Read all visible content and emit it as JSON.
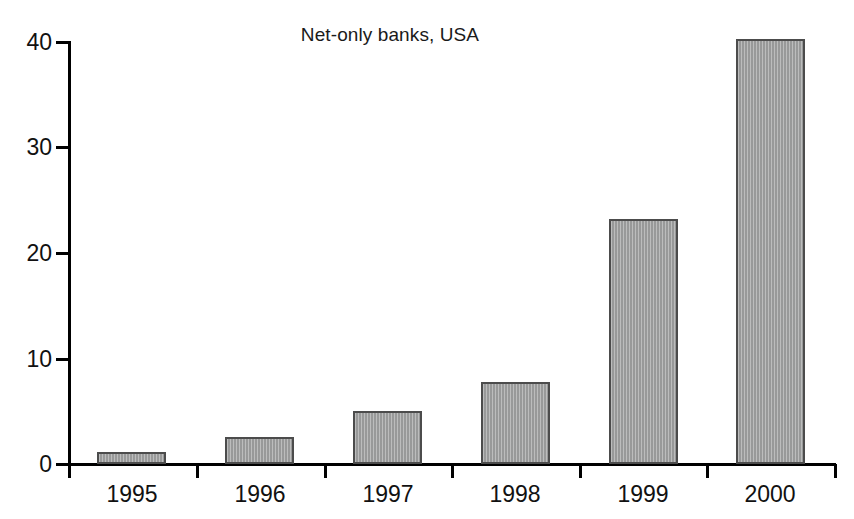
{
  "chart_data": {
    "type": "bar",
    "title": "Net-only banks, USA",
    "xlabel": "",
    "ylabel": "",
    "categories": [
      "1995",
      "1996",
      "1997",
      "1998",
      "1999",
      "2000"
    ],
    "values": [
      1.1,
      2.6,
      5.0,
      7.8,
      23.2,
      40.3
    ],
    "ylim": [
      0,
      40
    ],
    "y_ticks": [
      0,
      10,
      20,
      30,
      40
    ],
    "y_tick_labels": [
      "0",
      "10",
      "20",
      "30",
      "40"
    ],
    "grid": false,
    "legend": "none",
    "bar_color": "#9fa0a0",
    "bar_edge_color": "#4c4c4c",
    "axis_color": "#000000",
    "background_color": "#ffffff"
  },
  "axis": {
    "y_labels": [
      "40",
      "30",
      "20",
      "10",
      "0"
    ],
    "x_labels": [
      "1995",
      "1996",
      "1997",
      "1998",
      "1999",
      "2000"
    ]
  }
}
